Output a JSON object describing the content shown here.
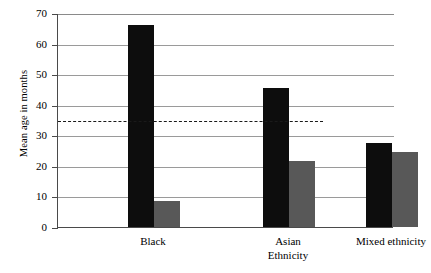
{
  "chart_data": {
    "type": "bar",
    "title": "",
    "xlabel": "Ethnicity",
    "ylabel": "Mean age in months",
    "categories": [
      "Black",
      "Asian",
      "Mixed ethnicity"
    ],
    "series": [
      {
        "name": "series-1",
        "color": "#0d0d0d",
        "values": [
          66,
          45.5,
          27.5
        ]
      },
      {
        "name": "series-2",
        "color": "#585858",
        "values": [
          8.5,
          21.5,
          24.5
        ]
      }
    ],
    "ylim": [
      0,
      70
    ],
    "ytick_values": [
      0,
      10,
      20,
      30,
      40,
      50,
      60,
      70
    ],
    "ytick_labels": [
      "0",
      "10",
      "20",
      "30",
      "40",
      "50",
      "60",
      "70"
    ],
    "grid": true,
    "legend": "none",
    "annotations": [
      {
        "name": "reference-line",
        "type": "hline",
        "value": 35,
        "style": "dashed",
        "color": "#1a1a1a",
        "x_start_fraction": 0,
        "x_end_fraction": 0.79
      }
    ]
  }
}
